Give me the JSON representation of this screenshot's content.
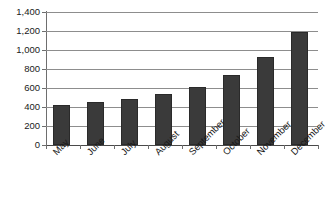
{
  "chart_data": {
    "type": "bar",
    "title": "",
    "subtitle": "",
    "xlabel": "",
    "ylabel": "",
    "categories": [
      "May",
      "June",
      "July",
      "August",
      "September",
      "October",
      "November",
      "December"
    ],
    "values": [
      420,
      450,
      480,
      540,
      610,
      740,
      925,
      1190
    ],
    "series": [
      {
        "name": "",
        "values": [
          420,
          450,
          480,
          540,
          610,
          740,
          925,
          1190
        ]
      }
    ],
    "ylim": [
      0,
      1400
    ],
    "y_ticks": [
      0,
      200,
      400,
      600,
      800,
      1000,
      1200,
      1400
    ],
    "y_tick_labels": [
      "0",
      "200",
      "400",
      "600",
      "800",
      "1,000",
      "1,200",
      "1,400"
    ],
    "grid": true,
    "grid_axis": "y",
    "legend": false,
    "legend_position": "none",
    "bar_color": "#3a3a3a",
    "gridline_color": "#8d8d8d",
    "axis_color": "#6e6e6e",
    "background_color": "#ffffff",
    "x_label_rotation": -45,
    "annotations": []
  },
  "figure": {
    "title_remnant": ""
  }
}
